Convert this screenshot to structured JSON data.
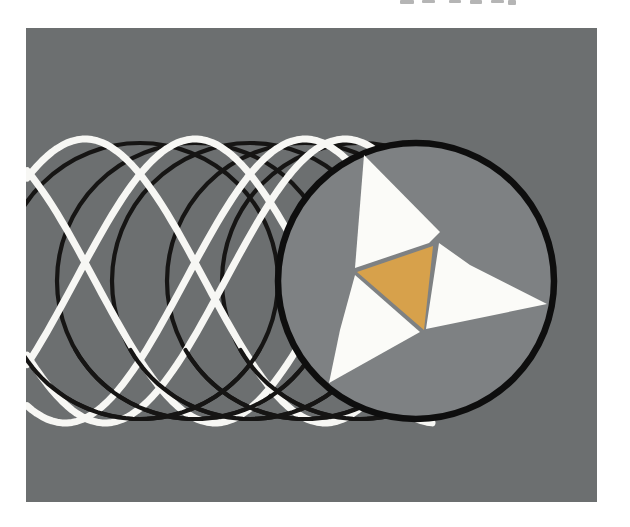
{
  "canvas": {
    "width": 630,
    "height": 527,
    "background": "#ffffff"
  },
  "figure": {
    "panel": {
      "x": 26,
      "y": 28,
      "width": 571,
      "height": 474,
      "fill": "#6c6f70"
    },
    "tube": {
      "center_y": 281,
      "radius": 138,
      "back_circle_xs": [
        140,
        195,
        250,
        305,
        360
      ],
      "stroke": "#161514",
      "stroke_width": 4.2
    },
    "mesh": {
      "center_y": 281,
      "amplitude": 142,
      "period": 480,
      "peak_xs": [
        -135,
        -25,
        85,
        195,
        305
      ],
      "x_start": 27,
      "x_end": 432,
      "stroke": "#f7f7f4",
      "stroke_width": 7
    },
    "weave_bottom_arc": {
      "start_deg": 150,
      "end_deg": 30
    },
    "front_disc": {
      "cx": 416,
      "cy": 281,
      "r": 138,
      "fill": "#7e8183",
      "stroke": "#0e0e0e",
      "stroke_width": 6.5
    },
    "pinwheel": {
      "blade_fill": "#fbfbf8",
      "blades": [
        {
          "id": "top",
          "points": [
            [
              364,
              155
            ],
            [
              355,
              268
            ],
            [
              429,
              243
            ],
            [
              440,
              232
            ]
          ]
        },
        {
          "id": "right",
          "points": [
            [
              439,
              243
            ],
            [
              470,
              265
            ],
            [
              547,
              304
            ],
            [
              426,
              329
            ]
          ]
        },
        {
          "id": "bottom-left",
          "points": [
            [
              355,
              275
            ],
            [
              420,
              332
            ],
            [
              329,
              383
            ],
            [
              340,
              330
            ]
          ]
        }
      ],
      "center_triangle": {
        "fill": "#d7a14b",
        "points": [
          [
            433,
            246
          ],
          [
            357,
            272
          ],
          [
            424,
            330
          ]
        ]
      }
    },
    "cropped_text_marks": {
      "color": "#b5b5b5",
      "marks": [
        {
          "x": 400,
          "w": 14,
          "h": 4
        },
        {
          "x": 422,
          "w": 13,
          "h": 3
        },
        {
          "x": 449,
          "w": 12,
          "h": 3
        },
        {
          "x": 470,
          "w": 12,
          "h": 4
        },
        {
          "x": 491,
          "w": 13,
          "h": 3
        },
        {
          "x": 508,
          "w": 8,
          "h": 5
        }
      ]
    }
  }
}
